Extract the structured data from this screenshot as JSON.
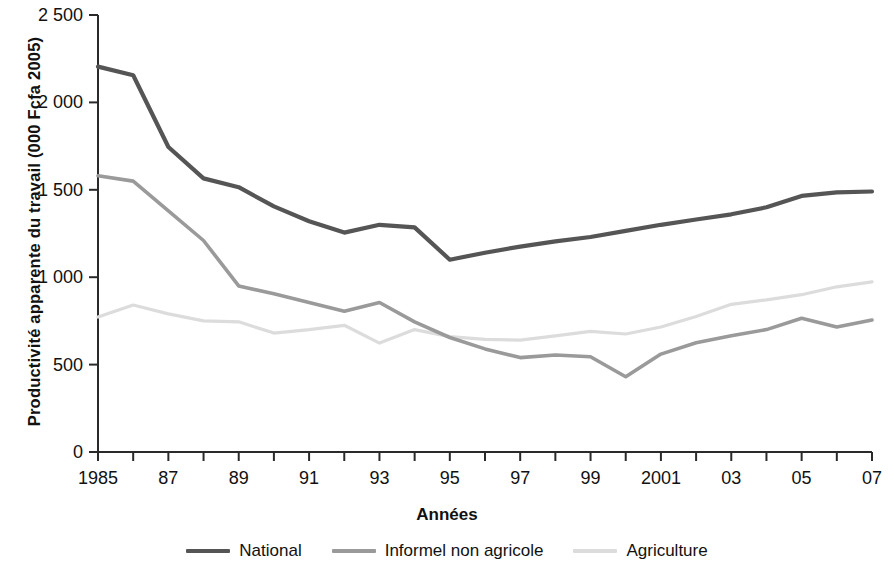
{
  "chart_data": {
    "type": "line",
    "title": "",
    "xlabel": "Années",
    "ylabel": "Productivité apparente du travail (000 Fcfa 2005)",
    "x": [
      1985,
      1986,
      1987,
      1988,
      1989,
      1990,
      1991,
      1992,
      1993,
      1994,
      1995,
      1996,
      1997,
      1998,
      1999,
      2000,
      2001,
      2002,
      2003,
      2004,
      2005,
      2006,
      2007
    ],
    "xtick_labels": [
      "1985",
      "",
      "87",
      "",
      "89",
      "",
      "91",
      "",
      "93",
      "",
      "95",
      "",
      "97",
      "",
      "99",
      "",
      "2001",
      "",
      "03",
      "",
      "05",
      "",
      "07"
    ],
    "xlim": [
      1985,
      2007
    ],
    "ylim": [
      0,
      2500
    ],
    "ytick_values": [
      0,
      500,
      1000,
      1500,
      2000,
      2500
    ],
    "ytick_labels": [
      "0",
      "500",
      "1 000",
      "1 500",
      "2 000",
      "2 500"
    ],
    "grid": false,
    "legend_position": "bottom",
    "series": [
      {
        "name": "National",
        "color": "#555555",
        "width": 4.2,
        "values": [
          2205,
          2155,
          1745,
          1565,
          1515,
          1405,
          1320,
          1255,
          1300,
          1285,
          1100,
          1140,
          1175,
          1205,
          1230,
          1265,
          1300,
          1330,
          1360,
          1400,
          1465,
          1485,
          1490
        ]
      },
      {
        "name": "Informel non agricole",
        "color": "#9a9a9a",
        "width": 3.6,
        "values": [
          1580,
          1550,
          1380,
          1210,
          950,
          905,
          855,
          805,
          855,
          745,
          655,
          590,
          540,
          555,
          545,
          430,
          560,
          625,
          665,
          700,
          765,
          715,
          755
        ]
      },
      {
        "name": "Agriculture",
        "color": "#dcdcdc",
        "width": 3.2,
        "values": [
          772,
          841,
          790,
          750,
          745,
          680,
          700,
          725,
          623,
          700,
          660,
          645,
          640,
          665,
          690,
          675,
          715,
          775,
          845,
          870,
          900,
          945,
          973
        ]
      }
    ]
  },
  "axis": {
    "y_top_label": "2 500",
    "x_first_label": "1985",
    "x_last_label": "07"
  },
  "legend": {
    "items": [
      {
        "label": "National",
        "color": "#555555"
      },
      {
        "label": "Informel non agricole",
        "color": "#9a9a9a"
      },
      {
        "label": "Agriculture",
        "color": "#dcdcdc"
      }
    ]
  }
}
